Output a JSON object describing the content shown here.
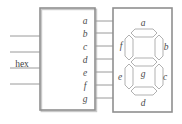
{
  "diagram": {
    "block": {
      "label": "hex",
      "x": 40,
      "y": 8,
      "w": 55,
      "h": 102
    },
    "inputs": [
      {
        "name": "input-line-1",
        "y": 36
      },
      {
        "name": "input-line-2",
        "y": 52
      },
      {
        "name": "input-line-3",
        "y": 68
      },
      {
        "name": "input-line-4",
        "y": 84
      }
    ],
    "outputs": [
      {
        "label": "a",
        "y": 21,
        "name": "output-a"
      },
      {
        "label": "b",
        "y": 33,
        "name": "output-b"
      },
      {
        "label": "c",
        "y": 46,
        "name": "output-c"
      },
      {
        "label": "d",
        "y": 59,
        "name": "output-d"
      },
      {
        "label": "e",
        "y": 72,
        "name": "output-e"
      },
      {
        "label": "f",
        "y": 85,
        "name": "output-f"
      },
      {
        "label": "g",
        "y": 98,
        "name": "output-g"
      }
    ],
    "display": {
      "x": 113,
      "y": 8,
      "w": 59,
      "h": 104,
      "segments": [
        {
          "id": "a",
          "label": "a",
          "position": "top",
          "lx": 143,
          "ly": 29
        },
        {
          "id": "b",
          "label": "b",
          "position": "upper-right",
          "lx": 165,
          "ly": 47
        },
        {
          "id": "c",
          "label": "c",
          "position": "lower-right",
          "lx": 163,
          "ly": 78
        },
        {
          "id": "d",
          "label": "d",
          "position": "bottom",
          "lx": 142,
          "ly": 104
        },
        {
          "id": "e",
          "label": "e",
          "position": "lower-left",
          "lx": 121,
          "ly": 78
        },
        {
          "id": "f",
          "label": "f",
          "position": "upper-left",
          "lx": 122,
          "ly": 46
        },
        {
          "id": "g",
          "label": "g",
          "position": "middle",
          "lx": 143,
          "ly": 73
        }
      ]
    },
    "colors": {
      "stroke": "#9a9a9a",
      "block_stroke": "#8f8f8f",
      "text": "#4b4b4b",
      "background": "#ffffff"
    }
  }
}
